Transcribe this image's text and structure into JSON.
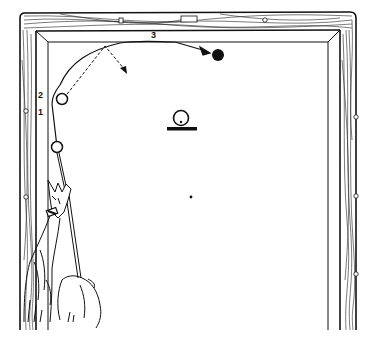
{
  "diagram": {
    "labels": {
      "point_1": "1",
      "point_2": "2",
      "point_3": "3"
    },
    "colors": {
      "ink": "#111111",
      "background": "#ffffff"
    },
    "elements": {
      "cue_ball_start": "cue ball at position 1",
      "cue_ball_curve": "cue ball at position 2",
      "object_ball": "black object ball (target)",
      "center_marker": "ball on spot with base line",
      "center_spot": "table center spot",
      "dashed_path": "dashed straight-line reference path with arrow",
      "curved_path": "curved cue ball path with arrow",
      "hand_and_cue": "shooter's hand holding cue vertically"
    }
  }
}
